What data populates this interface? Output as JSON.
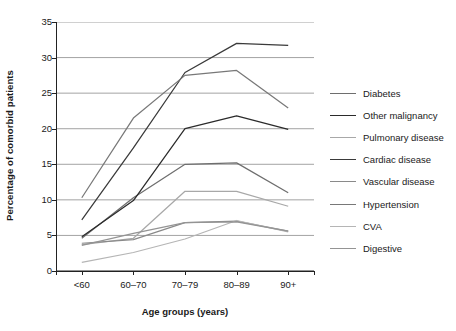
{
  "chart_data": {
    "type": "line",
    "title": "",
    "xlabel": "Age groups (years)",
    "ylabel": "Percentage of comorbid patients",
    "categories": [
      "<60",
      "60–70",
      "70–79",
      "80–89",
      "90+"
    ],
    "ylim": [
      0,
      35
    ],
    "yticks": [
      0,
      5,
      10,
      15,
      20,
      25,
      30,
      35
    ],
    "grid": true,
    "legend_position": "right",
    "series": [
      {
        "name": "Diabetes",
        "color": "#6e6e6e",
        "values": [
          4.6,
          10.3,
          15.0,
          15.2,
          11.0
        ]
      },
      {
        "name": "Other malignancy",
        "color": "#2b2b2b",
        "values": [
          4.8,
          9.9,
          20.0,
          21.8,
          19.9
        ]
      },
      {
        "name": "Pulmonary disease",
        "color": "#a8a8a8",
        "values": [
          3.7,
          4.6,
          11.2,
          11.2,
          9.1
        ]
      },
      {
        "name": "Cardiac disease",
        "color": "#3a3a3a",
        "values": [
          7.2,
          17.3,
          27.9,
          32.0,
          31.7
        ]
      },
      {
        "name": "Vascular disease",
        "color": "#8a8a8a",
        "values": [
          3.9,
          4.4,
          6.8,
          7.0,
          5.6
        ]
      },
      {
        "name": "Hypertension",
        "color": "#787878",
        "values": [
          10.3,
          21.5,
          27.5,
          28.2,
          22.9
        ]
      },
      {
        "name": "CVA",
        "color": "#b5b5b5",
        "values": [
          1.2,
          2.6,
          4.5,
          7.1,
          5.5
        ]
      },
      {
        "name": "Digestive",
        "color": "#949494",
        "values": [
          3.6,
          5.3,
          6.8,
          6.9,
          5.6
        ]
      }
    ]
  },
  "axes": {
    "y_title": "Percentage of comorbid patients",
    "x_title": "Age groups (years)",
    "y_tick_labels": [
      "0",
      "5",
      "10",
      "15",
      "20",
      "25",
      "30",
      "35"
    ],
    "x_tick_labels": [
      "<60",
      "60–70",
      "70–79",
      "80–89",
      "90+"
    ]
  },
  "legend": {
    "items": [
      {
        "label": "Diabetes"
      },
      {
        "label": "Other malignancy"
      },
      {
        "label": "Pulmonary disease"
      },
      {
        "label": "Cardiac disease"
      },
      {
        "label": "Vascular disease"
      },
      {
        "label": "Hypertension"
      },
      {
        "label": "CVA"
      },
      {
        "label": "Digestive"
      }
    ]
  }
}
